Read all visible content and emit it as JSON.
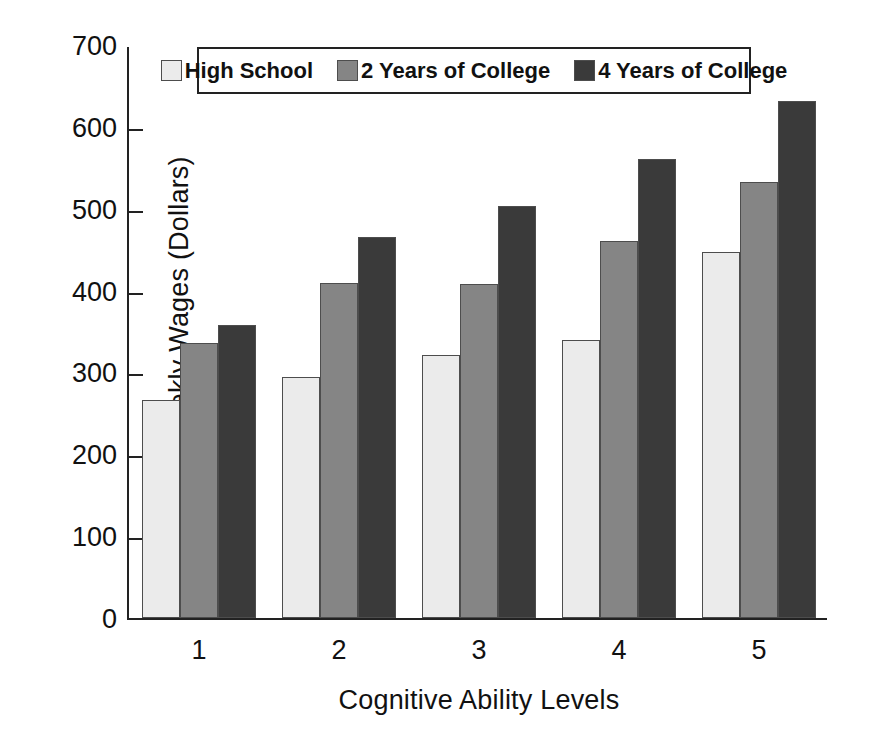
{
  "chart_data": {
    "type": "bar",
    "title": "",
    "xlabel": "Cognitive Ability Levels",
    "ylabel": "Weekly Wages (Dollars)",
    "categories": [
      "1",
      "2",
      "3",
      "4",
      "5"
    ],
    "series": [
      {
        "name": "High School",
        "color": "#ebebeb",
        "values": [
          266,
          295,
          321,
          340,
          447
        ]
      },
      {
        "name": "2 Years of College",
        "color": "#858585",
        "values": [
          336,
          409,
          408,
          460,
          533
        ]
      },
      {
        "name": "4 Years of College",
        "color": "#3a3a3a",
        "values": [
          358,
          466,
          503,
          561,
          631
        ]
      }
    ],
    "ylim": [
      0,
      700
    ],
    "ytick_labels": [
      "0",
      "100",
      "200",
      "300",
      "400",
      "500",
      "600",
      "700"
    ],
    "ytick_values": [
      0,
      100,
      200,
      300,
      400,
      500,
      600,
      700
    ],
    "grid": false,
    "legend_position": "top-center"
  },
  "legend": {
    "items": [
      {
        "label": "High School",
        "swatch_color": "#ebebeb"
      },
      {
        "label": "2 Years of College",
        "swatch_color": "#858585"
      },
      {
        "label": "4 Years of College",
        "swatch_color": "#3a3a3a"
      }
    ]
  },
  "axes": {
    "y_title": "Weekly Wages (Dollars)",
    "x_title": "Cognitive Ability Levels"
  }
}
